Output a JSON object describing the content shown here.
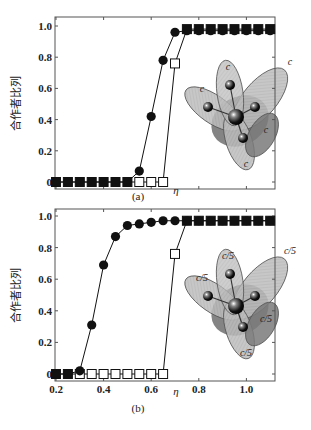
{
  "chart_data": [
    {
      "type": "line",
      "panel": "(a)",
      "title": "",
      "xlabel": "η",
      "ylabel": "合作者比列",
      "xlim": [
        0.2,
        1.12
      ],
      "ylim": [
        0,
        1.0
      ],
      "xticks": [
        0.2,
        0.4,
        0.6,
        0.8,
        1.0
      ],
      "xtick_labels": [],
      "yticks": [
        0,
        0.2,
        0.4,
        0.6,
        0.8,
        1.0
      ],
      "ytick_labels": [
        "0",
        "0.2",
        "0.4",
        "0.6",
        "0.8",
        "1.0"
      ],
      "grid": false,
      "x": [
        0.2,
        0.25,
        0.3,
        0.35,
        0.4,
        0.45,
        0.5,
        0.55,
        0.6,
        0.65,
        0.7,
        0.75,
        0.8,
        0.85,
        0.9,
        0.95,
        1.0,
        1.05,
        1.1
      ],
      "series": [
        {
          "name": "circles",
          "marker": "filled-circle",
          "values": [
            0,
            0,
            0,
            0,
            0,
            0,
            0,
            0.07,
            0.42,
            0.78,
            0.96,
            0.97,
            0.97,
            0.97,
            0.97,
            0.97,
            0.97,
            0.97,
            0.97
          ]
        },
        {
          "name": "squares",
          "marker": "open-square",
          "values": [
            0,
            0,
            0,
            0,
            0,
            0,
            0,
            0,
            0,
            0,
            0.76,
            0.98,
            0.98,
            0.98,
            0.98,
            0.98,
            0.98,
            0.98,
            0.98
          ]
        }
      ],
      "inset": {
        "labels": [
          "c",
          "c",
          "c",
          "c",
          "c"
        ]
      }
    },
    {
      "type": "line",
      "panel": "(b)",
      "title": "",
      "xlabel": "η",
      "ylabel": "合作者比列",
      "xlim": [
        0.2,
        1.12
      ],
      "ylim": [
        0,
        1.0
      ],
      "xticks": [
        0.2,
        0.4,
        0.6,
        0.8,
        1.0
      ],
      "xtick_labels": [
        "0.2",
        "0.4",
        "0.6",
        "0.8",
        "1.0"
      ],
      "yticks": [
        0,
        0.2,
        0.4,
        0.6,
        0.8,
        1.0
      ],
      "ytick_labels": [
        "0",
        "0.2",
        "0.4",
        "0.6",
        "0.8",
        "1.0"
      ],
      "grid": false,
      "x": [
        0.2,
        0.25,
        0.3,
        0.35,
        0.4,
        0.45,
        0.5,
        0.55,
        0.6,
        0.65,
        0.7,
        0.75,
        0.8,
        0.85,
        0.9,
        0.95,
        1.0,
        1.05,
        1.1
      ],
      "series": [
        {
          "name": "circles",
          "marker": "filled-circle",
          "values": [
            0,
            0,
            0.02,
            0.31,
            0.69,
            0.87,
            0.94,
            0.95,
            0.96,
            0.97,
            0.97,
            0.97,
            0.97,
            0.97,
            0.97,
            0.97,
            0.97,
            0.97,
            0.97
          ]
        },
        {
          "name": "squares",
          "marker": "open-square",
          "values": [
            0,
            0,
            0,
            0,
            0,
            0,
            0,
            0,
            0,
            0,
            0.76,
            0.97,
            0.97,
            0.97,
            0.97,
            0.97,
            0.97,
            0.97,
            0.97
          ]
        }
      ],
      "inset": {
        "labels": [
          "c/5",
          "c/5",
          "c/5",
          "c/5",
          "c/5"
        ]
      }
    }
  ]
}
